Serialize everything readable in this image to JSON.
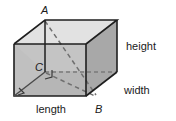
{
  "figure": {
    "shape": "rectangular-prism",
    "background_color": "#ffffff",
    "stroke_color": "#1a1a1a",
    "dashed_stroke_color": "#6b6b6b",
    "faces": {
      "top_fill": "#dedede",
      "front_fill": "#bdbdbd",
      "right_fill": "#a9a9a9",
      "left_fill": "#cfcfcf",
      "interior_floor_fill": "#c9c9c9"
    },
    "dimension_labels": {
      "height": "height",
      "width": "width",
      "length": "length"
    },
    "vertex_labels": {
      "a": "A",
      "b": "B",
      "c": "C"
    },
    "geometry": {
      "front_top_left": [
        14,
        44
      ],
      "front_top_right": [
        86,
        44
      ],
      "front_bottom_left": [
        14,
        96
      ],
      "front_bottom_right": [
        86,
        96
      ],
      "back_top_left": [
        45,
        20
      ],
      "back_top_right": [
        117,
        20
      ],
      "back_bottom_right": [
        117,
        72
      ],
      "back_bottom_left": [
        45,
        72
      ],
      "point_a": [
        45,
        20
      ],
      "point_b": [
        97,
        96
      ],
      "point_c": [
        45,
        72
      ]
    },
    "dashed_segments": [
      "A-to-B diagonal",
      "C-to-B diagonal",
      "hidden back-bottom-left edges"
    ],
    "right_angle_markers": [
      "at C",
      "at front-bottom-left corner"
    ]
  }
}
